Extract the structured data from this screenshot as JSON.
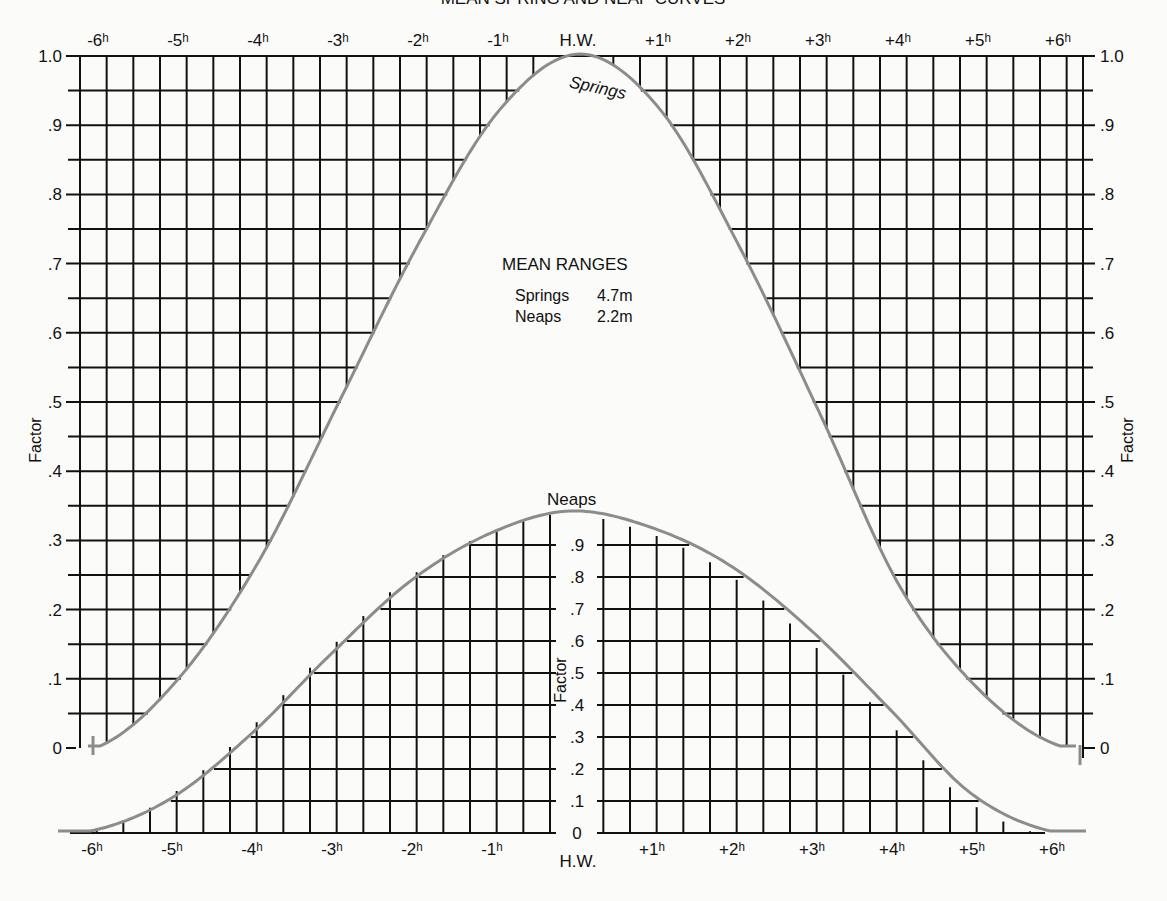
{
  "title": "MEAN SPRING AND NEAP CURVES",
  "info_box": {
    "heading": "MEAN RANGES",
    "rows": [
      {
        "label": "Springs",
        "value": "4.7m"
      },
      {
        "label": "Neaps",
        "value": "2.2m"
      }
    ]
  },
  "curve_labels": {
    "springs": "Springs",
    "neaps": "Neaps"
  },
  "axis_label": "Factor",
  "top_x_ticks": [
    "-6h",
    "-5h",
    "-4h",
    "-3h",
    "-2h",
    "-1h",
    "H.W.",
    "+1h",
    "+2h",
    "+3h",
    "+4h",
    "+5h",
    "+6h"
  ],
  "bottom_x_ticks": [
    "-6h",
    "-5h",
    "-4h",
    "-3h",
    "-2h",
    "-1h",
    "H.W.",
    "+1h",
    "+2h",
    "+3h",
    "+4h",
    "+5h",
    "+6h"
  ],
  "springs_y_ticks": [
    "0",
    ".1",
    ".2",
    ".3",
    ".4",
    ".5",
    ".6",
    ".7",
    ".8",
    ".9",
    "1.0"
  ],
  "neaps_y_ticks": [
    "0",
    ".1",
    ".2",
    ".3",
    ".4",
    ".5",
    ".6",
    ".7",
    ".8",
    ".9"
  ],
  "colors": {
    "grid": "#111111",
    "curve": "#8c8c8c",
    "background": "#fbfbf9"
  },
  "chart_data": [
    {
      "type": "line",
      "title": "Mean Spring Curve",
      "xlabel": "Hours relative to High Water",
      "ylabel": "Factor",
      "x": [
        -6,
        -5,
        -4,
        -3,
        -2,
        -1,
        0,
        1,
        2,
        3,
        4,
        5,
        6
      ],
      "series": [
        {
          "name": "Springs",
          "values": [
            0.0,
            0.1,
            0.27,
            0.5,
            0.73,
            0.92,
            1.0,
            0.92,
            0.72,
            0.48,
            0.23,
            0.08,
            0.0
          ]
        }
      ],
      "ylim": [
        0,
        1.0
      ],
      "grid": true
    },
    {
      "type": "line",
      "title": "Mean Neap Curve",
      "xlabel": "Hours relative to High Water",
      "ylabel": "Factor",
      "x": [
        -6,
        -5,
        -4,
        -3,
        -2,
        -1,
        0,
        1,
        2,
        3,
        4,
        5,
        6
      ],
      "series": [
        {
          "name": "Neaps",
          "values": [
            0.0,
            0.1,
            0.3,
            0.55,
            0.78,
            0.93,
            1.0,
            0.95,
            0.83,
            0.63,
            0.38,
            0.12,
            0.0
          ]
        }
      ],
      "ylim": [
        0,
        1.0
      ],
      "grid": true
    }
  ]
}
